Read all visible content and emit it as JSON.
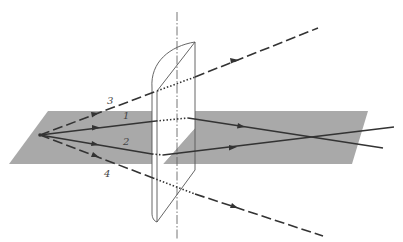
{
  "figure": {
    "colors": {
      "background": "#ffffff",
      "plane": "#a9a9a9",
      "ray": "#333333",
      "lens_outline": "#555555",
      "axis": "#666666"
    },
    "ray_labels": {
      "ray1": "1",
      "ray2": "2",
      "ray3": "3",
      "ray4": "4"
    }
  }
}
